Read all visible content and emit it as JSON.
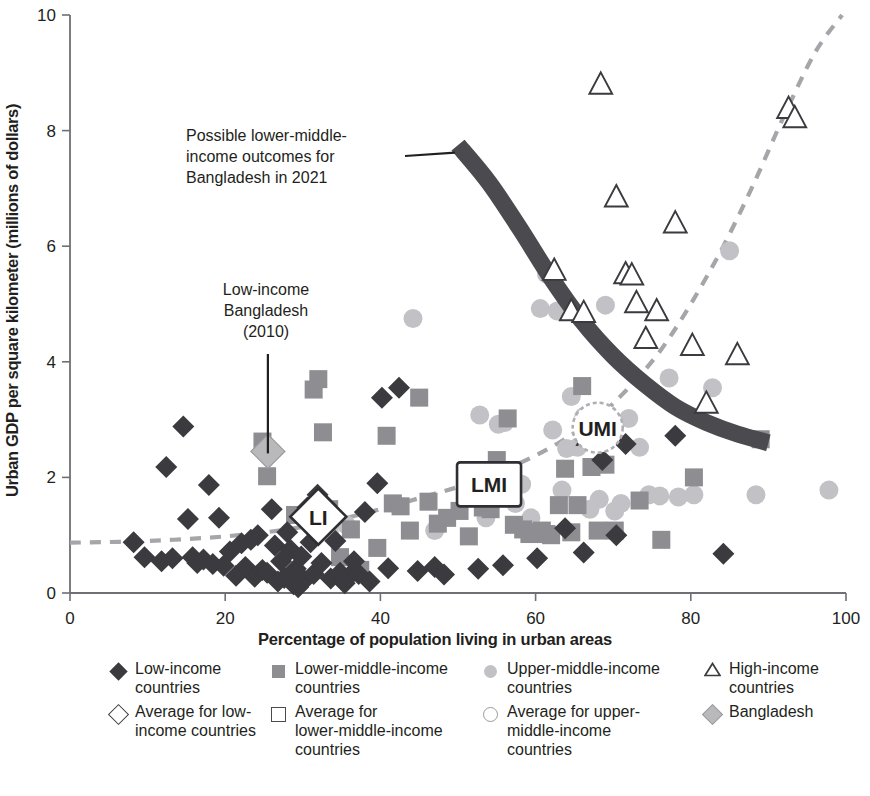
{
  "chart_data": {
    "type": "scatter",
    "title": "",
    "xlabel": "Percentage of population living in urban areas",
    "ylabel": "Urban GDP per square kilometer (millions of dollars)",
    "xlim": [
      0,
      100
    ],
    "ylim": [
      0,
      10
    ],
    "xticks": [
      "0",
      "20",
      "40",
      "60",
      "80",
      "100"
    ],
    "yticks": [
      "0",
      "2",
      "4",
      "6",
      "8",
      "10"
    ],
    "grid": false,
    "legend_position": "below-axis",
    "series": [
      {
        "name": "Low-income countries",
        "marker": "filled-diamond",
        "color": "#3a3a3f",
        "points": [
          [
            8.2,
            0.88
          ],
          [
            9.6,
            0.62
          ],
          [
            11.8,
            0.55
          ],
          [
            12.4,
            2.18
          ],
          [
            13.2,
            0.6
          ],
          [
            14.6,
            2.88
          ],
          [
            15.2,
            1.28
          ],
          [
            15.8,
            0.62
          ],
          [
            16.4,
            0.52
          ],
          [
            17.2,
            0.58
          ],
          [
            17.9,
            1.87
          ],
          [
            18.4,
            0.5
          ],
          [
            19.2,
            1.3
          ],
          [
            19.8,
            0.47
          ],
          [
            20.6,
            0.72
          ],
          [
            21.4,
            0.3
          ],
          [
            22.1,
            0.86
          ],
          [
            22.6,
            0.45
          ],
          [
            23.3,
            0.92
          ],
          [
            23.8,
            0.28
          ],
          [
            24.2,
            1.0
          ],
          [
            24.8,
            0.4
          ],
          [
            25.4,
            0.35
          ],
          [
            26.0,
            1.45
          ],
          [
            26.4,
            0.82
          ],
          [
            26.8,
            0.2
          ],
          [
            27.2,
            0.55
          ],
          [
            27.6,
            0.26
          ],
          [
            28.0,
            1.05
          ],
          [
            28.4,
            0.75
          ],
          [
            28.8,
            0.15
          ],
          [
            29.1,
            0.42
          ],
          [
            29.4,
            0.1
          ],
          [
            29.8,
            0.63
          ],
          [
            30.2,
            0.22
          ],
          [
            30.6,
            1.48
          ],
          [
            31.0,
            0.88
          ],
          [
            31.4,
            0.33
          ],
          [
            31.9,
            1.7
          ],
          [
            32.4,
            0.52
          ],
          [
            33.0,
            1.52
          ],
          [
            33.6,
            0.25
          ],
          [
            34.2,
            0.9
          ],
          [
            34.8,
            0.35
          ],
          [
            35.4,
            0.17
          ],
          [
            36.0,
            0.3
          ],
          [
            36.6,
            0.55
          ],
          [
            37.2,
            0.33
          ],
          [
            38.0,
            1.4
          ],
          [
            38.6,
            0.2
          ],
          [
            39.6,
            1.9
          ],
          [
            40.2,
            3.38
          ],
          [
            41.0,
            0.43
          ],
          [
            42.4,
            3.55
          ],
          [
            44.8,
            0.38
          ],
          [
            47.0,
            0.45
          ],
          [
            48.2,
            0.32
          ],
          [
            52.6,
            0.42
          ],
          [
            55.8,
            0.48
          ],
          [
            60.2,
            0.6
          ],
          [
            63.8,
            1.12
          ],
          [
            66.2,
            0.7
          ],
          [
            68.6,
            2.3
          ],
          [
            70.4,
            1.0
          ],
          [
            71.6,
            2.58
          ],
          [
            78.0,
            2.72
          ],
          [
            84.2,
            0.68
          ]
        ]
      },
      {
        "name": "Lower-middle-income countries",
        "marker": "filled-square",
        "color": "#8d8d92",
        "points": [
          [
            24.8,
            2.62
          ],
          [
            25.4,
            2.02
          ],
          [
            29.0,
            1.35
          ],
          [
            31.4,
            3.52
          ],
          [
            32.0,
            3.7
          ],
          [
            32.6,
            2.78
          ],
          [
            33.4,
            1.45
          ],
          [
            34.8,
            0.62
          ],
          [
            36.2,
            1.1
          ],
          [
            37.4,
            0.4
          ],
          [
            39.6,
            0.78
          ],
          [
            40.8,
            2.72
          ],
          [
            41.6,
            1.55
          ],
          [
            42.6,
            1.5
          ],
          [
            43.8,
            1.08
          ],
          [
            45.0,
            3.38
          ],
          [
            46.2,
            1.58
          ],
          [
            47.4,
            1.2
          ],
          [
            48.6,
            1.3
          ],
          [
            50.2,
            1.42
          ],
          [
            51.4,
            0.98
          ],
          [
            52.0,
            2.1
          ],
          [
            53.2,
            1.48
          ],
          [
            54.2,
            1.45
          ],
          [
            55.0,
            2.3
          ],
          [
            56.4,
            3.02
          ],
          [
            57.2,
            1.18
          ],
          [
            58.4,
            1.1
          ],
          [
            59.2,
            1.02
          ],
          [
            60.0,
            1.05
          ],
          [
            60.8,
            1.08
          ],
          [
            61.4,
            1.02
          ],
          [
            62.0,
            1.0
          ],
          [
            63.0,
            1.52
          ],
          [
            63.8,
            2.15
          ],
          [
            64.6,
            1.05
          ],
          [
            65.4,
            1.52
          ],
          [
            66.0,
            3.58
          ],
          [
            67.2,
            2.18
          ],
          [
            68.0,
            1.08
          ],
          [
            69.0,
            2.22
          ],
          [
            70.2,
            1.08
          ],
          [
            73.4,
            1.6
          ],
          [
            76.2,
            0.92
          ],
          [
            80.4,
            2.0
          ],
          [
            89.0,
            2.66
          ]
        ]
      },
      {
        "name": "Upper-middle-income countries",
        "marker": "filled-circle",
        "color": "#c2c2c6",
        "points": [
          [
            33.0,
            1.32
          ],
          [
            33.4,
            1.05
          ],
          [
            35.6,
            1.18
          ],
          [
            44.2,
            4.75
          ],
          [
            47.0,
            1.08
          ],
          [
            52.8,
            3.08
          ],
          [
            53.6,
            1.3
          ],
          [
            55.2,
            2.92
          ],
          [
            56.0,
            2.95
          ],
          [
            57.4,
            1.55
          ],
          [
            58.2,
            1.88
          ],
          [
            59.4,
            1.3
          ],
          [
            60.6,
            4.92
          ],
          [
            61.4,
            5.52
          ],
          [
            62.2,
            2.82
          ],
          [
            62.8,
            4.88
          ],
          [
            63.4,
            1.78
          ],
          [
            64.0,
            2.5
          ],
          [
            64.6,
            3.4
          ],
          [
            65.4,
            2.52
          ],
          [
            66.2,
            3.05
          ],
          [
            67.0,
            1.45
          ],
          [
            68.2,
            1.62
          ],
          [
            69.0,
            4.98
          ],
          [
            70.2,
            1.42
          ],
          [
            71.0,
            1.55
          ],
          [
            72.0,
            3.02
          ],
          [
            73.4,
            2.52
          ],
          [
            74.6,
            1.7
          ],
          [
            76.0,
            1.68
          ],
          [
            77.2,
            3.72
          ],
          [
            78.4,
            1.66
          ],
          [
            80.4,
            1.7
          ],
          [
            82.8,
            3.55
          ],
          [
            85.0,
            5.92
          ],
          [
            88.4,
            1.7
          ],
          [
            97.8,
            1.78
          ]
        ]
      },
      {
        "name": "High-income countries",
        "marker": "open-triangle",
        "color": "#3a3a3f",
        "points": [
          [
            62.4,
            5.58
          ],
          [
            64.6,
            4.88
          ],
          [
            66.2,
            4.85
          ],
          [
            66.8,
            2.72
          ],
          [
            68.4,
            8.8
          ],
          [
            70.4,
            6.85
          ],
          [
            71.6,
            5.52
          ],
          [
            72.4,
            5.5
          ],
          [
            73.0,
            5.02
          ],
          [
            74.2,
            4.4
          ],
          [
            75.6,
            4.88
          ],
          [
            78.0,
            6.4
          ],
          [
            80.2,
            4.28
          ],
          [
            82.0,
            3.28
          ],
          [
            86.0,
            4.12
          ],
          [
            92.6,
            8.38
          ],
          [
            93.4,
            8.22
          ]
        ]
      },
      {
        "name": "Bangladesh",
        "marker": "shaded-diamond",
        "color": "#b9b9bc",
        "points": [
          [
            25.5,
            2.45
          ]
        ]
      },
      {
        "name": "Average for low-income countries",
        "marker": "open-diamond-label",
        "label": "LI",
        "points": [
          [
            32.0,
            1.32
          ]
        ]
      },
      {
        "name": "Average for lower-middle-income countries",
        "marker": "open-square-label",
        "label": "LMI",
        "points": [
          [
            54.0,
            1.88
          ]
        ]
      },
      {
        "name": "Average for upper-middle-income countries",
        "marker": "open-circle-label",
        "label": "UMI",
        "points": [
          [
            68.0,
            2.86
          ]
        ]
      }
    ],
    "trend_curve": {
      "name": "Urbanization-density trend",
      "style": "dashed",
      "color": "#a6a6aa",
      "points": [
        [
          0,
          0.87
        ],
        [
          10,
          0.9
        ],
        [
          20,
          0.98
        ],
        [
          28,
          1.1
        ],
        [
          34,
          1.25
        ],
        [
          40,
          1.45
        ],
        [
          46,
          1.68
        ],
        [
          52,
          1.92
        ],
        [
          58,
          2.25
        ],
        [
          63,
          2.6
        ],
        [
          68,
          3.05
        ],
        [
          72,
          3.55
        ],
        [
          76,
          4.18
        ],
        [
          80,
          5.0
        ],
        [
          84,
          5.95
        ],
        [
          88,
          7.05
        ],
        [
          92,
          8.25
        ],
        [
          96,
          9.35
        ],
        [
          99.5,
          10.0
        ]
      ]
    },
    "band_curve": {
      "name": "Possible lower-middle-income outcomes band",
      "style": "thick-solid",
      "color": "#4a4a4f",
      "points": [
        [
          50.0,
          7.75
        ],
        [
          54.0,
          7.1
        ],
        [
          58.0,
          6.3
        ],
        [
          62.0,
          5.45
        ],
        [
          66.0,
          4.7
        ],
        [
          70.0,
          4.1
        ],
        [
          74.0,
          3.62
        ],
        [
          78.0,
          3.22
        ],
        [
          82.0,
          2.95
        ],
        [
          86.0,
          2.75
        ],
        [
          90.0,
          2.6
        ]
      ]
    },
    "annotations": [
      {
        "id": "band-annotation",
        "lines": [
          "Possible lower-middle-",
          "income outcomes for",
          "Bangladesh in 2021"
        ],
        "leader_to": [
          50.0,
          7.62
        ]
      },
      {
        "id": "bangladesh-annotation",
        "lines": [
          "Low-income",
          "Bangladesh",
          "(2010)"
        ],
        "leader_to": [
          25.5,
          2.45
        ]
      }
    ]
  },
  "legend": {
    "columns": [
      {
        "entries": [
          {
            "marker": "filled-diamond",
            "lines": [
              "Low-income",
              "countries"
            ]
          },
          {
            "marker": "open-diamond",
            "lines": [
              "Average for low-",
              "income countries"
            ]
          }
        ]
      },
      {
        "entries": [
          {
            "marker": "filled-square",
            "lines": [
              "Lower-middle-income",
              "countries"
            ]
          },
          {
            "marker": "open-square",
            "lines": [
              "Average for",
              "lower-middle-income",
              "countries"
            ]
          }
        ]
      },
      {
        "entries": [
          {
            "marker": "filled-circle",
            "lines": [
              "Upper-middle-income",
              "countries"
            ]
          },
          {
            "marker": "open-circle",
            "lines": [
              "Average for upper-",
              "middle-income",
              "countries"
            ]
          }
        ]
      },
      {
        "entries": [
          {
            "marker": "open-triangle",
            "lines": [
              "High-income",
              "countries"
            ]
          },
          {
            "marker": "shaded-diamond",
            "lines": [
              "Bangladesh"
            ]
          }
        ]
      }
    ]
  },
  "colors": {
    "axis": "#6f6f74",
    "text": "#231f20",
    "low_income": "#3a3a3f",
    "lower_middle": "#8d8d92",
    "upper_middle": "#c2c2c6",
    "high_income": "#3a3a3f",
    "bangladesh": "#b9b9bc",
    "trend": "#a6a6aa",
    "band": "#4a4a4f"
  }
}
